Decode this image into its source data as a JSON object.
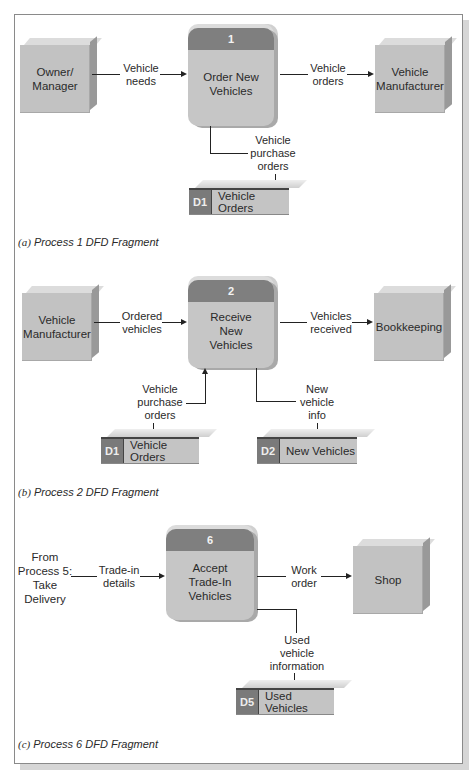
{
  "fragments": [
    {
      "caption_letter": "(a)",
      "caption_text": "Process 1 DFD Fragment",
      "process": {
        "number": "1",
        "name": "Order New Vehicles"
      },
      "entities": [
        "Owner/ Manager",
        "Vehicle Manufacturer"
      ],
      "stores": [
        {
          "id": "D1",
          "name": "Vehicle Orders"
        }
      ],
      "flows": [
        {
          "from": "Owner/Manager",
          "to": "Process 1",
          "label": "Vehicle needs"
        },
        {
          "from": "Process 1",
          "to": "Vehicle Manufacturer",
          "label": "Vehicle orders"
        },
        {
          "from": "Process 1",
          "to": "D1 Vehicle Orders",
          "label": "Vehicle purchase orders"
        }
      ]
    },
    {
      "caption_letter": "(b)",
      "caption_text": "Process 2 DFD Fragment",
      "process": {
        "number": "2",
        "name": "Receive New Vehicles"
      },
      "entities": [
        "Vehicle Manufacturer",
        "Bookkeeping"
      ],
      "stores": [
        {
          "id": "D1",
          "name": "Vehicle Orders"
        },
        {
          "id": "D2",
          "name": "New Vehicles"
        }
      ],
      "flows": [
        {
          "from": "Vehicle Manufacturer",
          "to": "Process 2",
          "label": "Ordered vehicles"
        },
        {
          "from": "Process 2",
          "to": "Bookkeeping",
          "label": "Vehicles received"
        },
        {
          "from": "D1 Vehicle Orders",
          "to": "Process 2",
          "label": "Vehicle purchase orders"
        },
        {
          "from": "Process 2",
          "to": "D2 New Vehicles",
          "label": "New vehicle info"
        }
      ]
    },
    {
      "caption_letter": "(c)",
      "caption_text": "Process 6 DFD Fragment",
      "process": {
        "number": "6",
        "name": "Accept Trade-In Vehicles"
      },
      "source_text": "From Process 5: Take Delivery",
      "entities": [
        "Shop"
      ],
      "stores": [
        {
          "id": "D5",
          "name": "Used Vehicles"
        }
      ],
      "flows": [
        {
          "from": "Process 5",
          "to": "Process 6",
          "label": "Trade-in details"
        },
        {
          "from": "Process 6",
          "to": "Shop",
          "label": "Work order"
        },
        {
          "from": "Process 6",
          "to": "D5 Used Vehicles",
          "label": "Used vehicle information"
        }
      ]
    }
  ],
  "text": {
    "a_entity_left_1": "Owner/",
    "a_entity_left_2": "Manager",
    "a_flow_in_1": "Vehicle",
    "a_flow_in_2": "needs",
    "a_proc_num": "1",
    "a_proc_1": "Order New",
    "a_proc_2": "Vehicles",
    "a_flow_out_1": "Vehicle",
    "a_flow_out_2": "orders",
    "a_entity_right_1": "Vehicle",
    "a_entity_right_2": "Manufacturer",
    "a_flow_store_1": "Vehicle",
    "a_flow_store_2": "purchase",
    "a_flow_store_3": "orders",
    "a_store_id": "D1",
    "a_store_name": "Vehicle Orders",
    "a_cap_letter": "(a)",
    "a_cap_text": "Process 1 DFD Fragment",
    "b_entity_left_1": "Vehicle",
    "b_entity_left_2": "Manufacturer",
    "b_flow_in_1": "Ordered",
    "b_flow_in_2": "vehicles",
    "b_proc_num": "2",
    "b_proc_1": "Receive",
    "b_proc_2": "New",
    "b_proc_3": "Vehicles",
    "b_flow_out_1": "Vehicles",
    "b_flow_out_2": "received",
    "b_entity_right": "Bookkeeping",
    "b_flow_s1_1": "Vehicle",
    "b_flow_s1_2": "purchase",
    "b_flow_s1_3": "orders",
    "b_flow_s2_1": "New",
    "b_flow_s2_2": "vehicle",
    "b_flow_s2_3": "info",
    "b_store1_id": "D1",
    "b_store1_name": "Vehicle Orders",
    "b_store2_id": "D2",
    "b_store2_name": "New Vehicles",
    "b_cap_letter": "(b)",
    "b_cap_text": "Process 2 DFD Fragment",
    "c_src_1": "From",
    "c_src_2": "Process 5:",
    "c_src_3": "Take",
    "c_src_4": "Delivery",
    "c_flow_in_1": "Trade-in",
    "c_flow_in_2": "details",
    "c_proc_num": "6",
    "c_proc_1": "Accept",
    "c_proc_2": "Trade-In",
    "c_proc_3": "Vehicles",
    "c_flow_out_1": "Work",
    "c_flow_out_2": "order",
    "c_entity_right": "Shop",
    "c_flow_store_1": "Used",
    "c_flow_store_2": "vehicle",
    "c_flow_store_3": "information",
    "c_store_id": "D5",
    "c_store_name": "Used Vehicles",
    "c_cap_letter": "(c)",
    "c_cap_text": "Process 6 DFD Fragment"
  }
}
